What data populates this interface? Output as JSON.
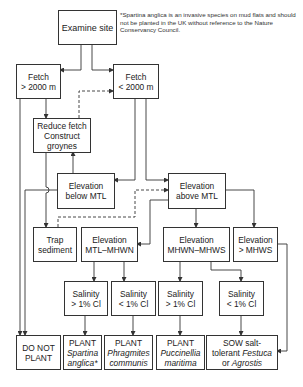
{
  "footnote": "*Spartina anglica is an invasive species on mud flats and should not be planted in the UK without reference to the Nature Conservancy Council.",
  "nodes": {
    "examine": {
      "line1": "Examine site"
    },
    "fetch_gt": {
      "line1": "Fetch",
      "line2": "> 2000 m"
    },
    "fetch_lt": {
      "line1": "Fetch",
      "line2": "< 2000 m"
    },
    "reduce": {
      "line1": "Reduce fetch",
      "line2": "Construct",
      "line3": "groynes"
    },
    "elev_below": {
      "line1": "Elevation",
      "line2": "below MTL"
    },
    "elev_above": {
      "line1": "Elevation",
      "line2": "above MTL"
    },
    "trap": {
      "line1": "Trap",
      "line2": "sediment"
    },
    "elev_mtl_mhwn": {
      "line1": "Elevation",
      "line2": "MTL–MHWN"
    },
    "elev_mhwn_mhws": {
      "line1": "Elevation",
      "line2": "MHWN–MHWS"
    },
    "elev_gt_mhws": {
      "line1": "Elevation",
      "line2": "> MHWS"
    },
    "sal1": {
      "line1": "Salinity",
      "line2": "> 1% Cl"
    },
    "sal2": {
      "line1": "Salinity",
      "line2": "< 1% Cl"
    },
    "sal3": {
      "line1": "Salinity",
      "line2": "> 1% Cl"
    },
    "sal4": {
      "line1": "Salinity",
      "line2": "< 1% Cl"
    },
    "do_not": {
      "line1": "DO NOT",
      "line2": "PLANT"
    },
    "spartina": {
      "line1": "PLANT",
      "line2": "Spartina",
      "line3": "anglica*"
    },
    "phragmites": {
      "line1": "PLANT",
      "line2": "Phragmites",
      "line3": "communis"
    },
    "puccinellia": {
      "line1": "PLANT",
      "line2": "Puccinellia",
      "line3": "maritima"
    },
    "sow": {
      "line1": "SOW salt-",
      "line2a": "tolerant ",
      "line2b": "Festuca",
      "line3a": "or ",
      "line3b": "Agrostis"
    }
  },
  "colors": {
    "line": "#333333",
    "background": "#ffffff"
  }
}
